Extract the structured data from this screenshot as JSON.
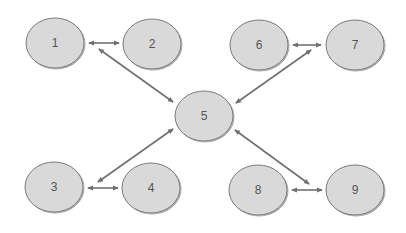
{
  "diagram": {
    "type": "network",
    "colors": {
      "node_fill": "#d9d9d9",
      "node_stroke": "#7a7a7a",
      "edge": "#707070",
      "label": "#555555",
      "background": "#ffffff"
    },
    "nodes": [
      {
        "id": "1",
        "label": "1",
        "cx": 55,
        "cy": 43
      },
      {
        "id": "2",
        "label": "2",
        "cx": 152,
        "cy": 44
      },
      {
        "id": "3",
        "label": "3",
        "cx": 54,
        "cy": 187
      },
      {
        "id": "4",
        "label": "4",
        "cx": 151,
        "cy": 188
      },
      {
        "id": "5",
        "label": "5",
        "cx": 204,
        "cy": 116
      },
      {
        "id": "6",
        "label": "6",
        "cx": 259,
        "cy": 45
      },
      {
        "id": "7",
        "label": "7",
        "cx": 355,
        "cy": 45
      },
      {
        "id": "8",
        "label": "8",
        "cx": 258,
        "cy": 190
      },
      {
        "id": "9",
        "label": "9",
        "cx": 355,
        "cy": 190
      }
    ],
    "edges": [
      {
        "from": "1",
        "to": "2",
        "direction": "both"
      },
      {
        "from": "1",
        "to": "5",
        "direction": "both"
      },
      {
        "from": "6",
        "to": "7",
        "direction": "both"
      },
      {
        "from": "7",
        "to": "5",
        "direction": "both"
      },
      {
        "from": "3",
        "to": "4",
        "direction": "both"
      },
      {
        "from": "3",
        "to": "5",
        "direction": "both"
      },
      {
        "from": "8",
        "to": "9",
        "direction": "both"
      },
      {
        "from": "9",
        "to": "5",
        "direction": "both"
      }
    ]
  }
}
